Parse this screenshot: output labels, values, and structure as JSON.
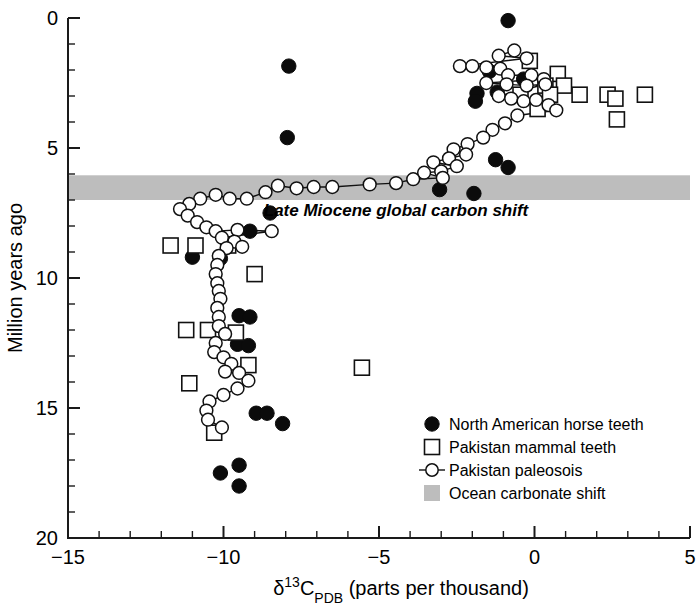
{
  "chart_data": {
    "type": "scatter",
    "title": "",
    "xlabel": "δ13CPDB (parts per thousand)",
    "xlabel_parts": {
      "delta": "δ",
      "sup": "13",
      "c": "C",
      "sub": "PDB",
      "rest": " (parts per thousand)"
    },
    "ylabel": "Million years ago",
    "xlim": [
      -15,
      5
    ],
    "ylim": [
      20,
      0
    ],
    "y_inverted": true,
    "grid": false,
    "x_major_ticks": [
      -15,
      -10,
      -5,
      0,
      5
    ],
    "x_major_ticklabels": [
      "−15",
      "−10",
      "−5",
      "0",
      "5"
    ],
    "x_minor_step": 1,
    "y_major_ticks": [
      0,
      5,
      10,
      15,
      20
    ],
    "y_major_ticklabels": [
      "0",
      "5",
      "10",
      "15",
      "20"
    ],
    "y_minor_step": 1,
    "legend_position": "lower-right-inside",
    "annotations": [
      {
        "text": "Late Miocene global carbon shift",
        "x": -0.2,
        "y": 7.6,
        "style": "bold-italic"
      }
    ],
    "bands": [
      {
        "name": "Ocean carbonate shift",
        "y_from": 6.05,
        "y_to": 7.0,
        "color": "#bdbdbd",
        "orientation": "horizontal",
        "x_from": -15,
        "x_to": 5
      }
    ],
    "series": [
      {
        "name": "North American horse teeth",
        "marker": "filled-circle",
        "color": "#0b0b0b",
        "points": [
          [
            -0.85,
            0.1
          ],
          [
            -7.9,
            1.85
          ],
          [
            -1.45,
            2.05
          ],
          [
            -0.35,
            2.35
          ],
          [
            -1.2,
            2.85
          ],
          [
            -1.85,
            2.9
          ],
          [
            -1.9,
            3.2
          ],
          [
            -1.25,
            5.45
          ],
          [
            -0.85,
            5.75
          ],
          [
            -7.95,
            4.6
          ],
          [
            -3.05,
            6.6
          ],
          [
            -1.95,
            6.75
          ],
          [
            -8.5,
            7.5
          ],
          [
            -9.15,
            8.2
          ],
          [
            -11.0,
            9.2
          ],
          [
            -10.1,
            9.25
          ],
          [
            -9.5,
            11.45
          ],
          [
            -9.15,
            11.5
          ],
          [
            -9.55,
            12.55
          ],
          [
            -9.2,
            12.6
          ],
          [
            -8.95,
            15.2
          ],
          [
            -8.6,
            15.2
          ],
          [
            -8.1,
            15.6
          ],
          [
            -9.5,
            17.2
          ],
          [
            -10.1,
            17.5
          ],
          [
            -9.5,
            18.0
          ]
        ]
      },
      {
        "name": "Pakistan mammal teeth",
        "marker": "open-square",
        "color": "#111111",
        "points": [
          [
            -0.15,
            1.65
          ],
          [
            0.75,
            2.15
          ],
          [
            0.35,
            2.6
          ],
          [
            0.95,
            2.6
          ],
          [
            -0.45,
            2.95
          ],
          [
            0.5,
            2.95
          ],
          [
            1.45,
            2.95
          ],
          [
            2.35,
            2.95
          ],
          [
            2.6,
            3.1
          ],
          [
            3.55,
            2.95
          ],
          [
            0.1,
            3.5
          ],
          [
            2.65,
            3.9
          ],
          [
            -11.7,
            8.75
          ],
          [
            -10.9,
            8.75
          ],
          [
            -9.85,
            8.75
          ],
          [
            -9.0,
            9.85
          ],
          [
            -11.2,
            12.0
          ],
          [
            -10.5,
            12.0
          ],
          [
            -9.6,
            12.1
          ],
          [
            -9.2,
            13.35
          ],
          [
            -5.55,
            13.45
          ],
          [
            -11.1,
            14.05
          ],
          [
            -10.3,
            15.95
          ]
        ]
      },
      {
        "name": "Pakistan paleosois",
        "marker": "open-circle-line",
        "color": "#111111",
        "points": [
          [
            -0.65,
            1.25
          ],
          [
            -1.15,
            1.45
          ],
          [
            -0.25,
            1.55
          ],
          [
            -2.4,
            1.85
          ],
          [
            -2.0,
            1.85
          ],
          [
            -1.55,
            1.9
          ],
          [
            -1.1,
            1.95
          ],
          [
            -0.85,
            2.2
          ],
          [
            -0.1,
            2.2
          ],
          [
            0.3,
            2.35
          ],
          [
            -1.55,
            2.5
          ],
          [
            -0.9,
            2.55
          ],
          [
            -0.25,
            2.6
          ],
          [
            0.35,
            2.55
          ],
          [
            -1.15,
            3.0
          ],
          [
            -0.75,
            3.1
          ],
          [
            -0.35,
            3.2
          ],
          [
            0.05,
            3.15
          ],
          [
            0.45,
            3.35
          ],
          [
            0.7,
            3.55
          ],
          [
            -0.55,
            3.75
          ],
          [
            -0.95,
            4.05
          ],
          [
            -1.35,
            4.3
          ],
          [
            -1.65,
            4.6
          ],
          [
            -2.15,
            4.85
          ],
          [
            -2.6,
            5.05
          ],
          [
            -2.2,
            5.25
          ],
          [
            -2.75,
            5.4
          ],
          [
            -3.25,
            5.55
          ],
          [
            -2.5,
            5.7
          ],
          [
            -3.0,
            5.9
          ],
          [
            -3.55,
            5.95
          ],
          [
            -2.95,
            6.15
          ],
          [
            -3.9,
            6.2
          ],
          [
            -4.45,
            6.35
          ],
          [
            -5.3,
            6.4
          ],
          [
            -6.5,
            6.5
          ],
          [
            -7.1,
            6.5
          ],
          [
            -7.65,
            6.55
          ],
          [
            -8.25,
            6.45
          ],
          [
            -8.65,
            6.7
          ],
          [
            -9.25,
            6.95
          ],
          [
            -9.8,
            6.95
          ],
          [
            -10.25,
            6.8
          ],
          [
            -10.75,
            6.95
          ],
          [
            -11.1,
            7.15
          ],
          [
            -11.4,
            7.35
          ],
          [
            -11.15,
            7.6
          ],
          [
            -10.85,
            7.85
          ],
          [
            -10.55,
            8.05
          ],
          [
            -10.25,
            8.2
          ],
          [
            -9.55,
            8.15
          ],
          [
            -8.45,
            8.2
          ],
          [
            -10.05,
            8.45
          ],
          [
            -9.65,
            8.6
          ],
          [
            -9.4,
            8.8
          ],
          [
            -9.9,
            8.85
          ],
          [
            -10.15,
            9.15
          ],
          [
            -10.2,
            9.5
          ],
          [
            -10.25,
            9.85
          ],
          [
            -10.2,
            10.2
          ],
          [
            -10.15,
            10.5
          ],
          [
            -10.1,
            10.8
          ],
          [
            -10.2,
            11.15
          ],
          [
            -10.15,
            11.5
          ],
          [
            -10.15,
            11.85
          ],
          [
            -9.95,
            12.15
          ],
          [
            -10.25,
            12.5
          ],
          [
            -10.3,
            12.85
          ],
          [
            -10.0,
            13.05
          ],
          [
            -9.75,
            13.3
          ],
          [
            -9.95,
            13.6
          ],
          [
            -9.5,
            13.65
          ],
          [
            -9.2,
            13.95
          ],
          [
            -9.55,
            14.25
          ],
          [
            -10.0,
            14.5
          ],
          [
            -10.45,
            14.75
          ],
          [
            -10.55,
            15.1
          ],
          [
            -10.5,
            15.45
          ],
          [
            -10.05,
            15.75
          ]
        ]
      }
    ],
    "legend": [
      {
        "label": "North American horse teeth",
        "marker": "filled-circle"
      },
      {
        "label": "Pakistan mammal teeth",
        "marker": "open-square"
      },
      {
        "label": "Pakistan paleosois",
        "marker": "open-circle-line"
      },
      {
        "label": "Ocean carbonate shift",
        "marker": "gray-band"
      }
    ]
  }
}
